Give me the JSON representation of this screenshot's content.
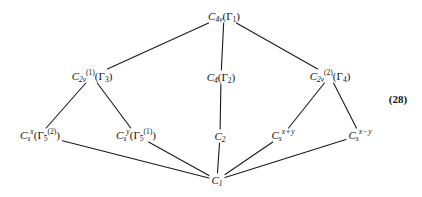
{
  "diagram": {
    "equation_number": "(28)",
    "line_color": "#1a1a1a",
    "background_color": "#ffffff",
    "nodes": [
      {
        "id": "c4v",
        "label": "C4v(Γ1)",
        "base": "C",
        "base_sub": "4v",
        "irrep": "Γ1",
        "x": 224,
        "y": 16
      },
      {
        "id": "c2v1",
        "label": "C2v(1)(Γ3)",
        "base": "C",
        "base_sub": "2v",
        "base_sup": "(1)",
        "irrep": "Γ3",
        "x": 92,
        "y": 76
      },
      {
        "id": "c4",
        "label": "C4(Γ2)",
        "base": "C",
        "base_sub": "4",
        "irrep": "Γ2",
        "x": 221,
        "y": 77
      },
      {
        "id": "c2v2",
        "label": "C2v(2)(Γ4)",
        "base": "C",
        "base_sub": "2v",
        "base_sup": "(2)",
        "irrep": "Γ4",
        "x": 330,
        "y": 76
      },
      {
        "id": "csx",
        "label": "Csx(Γ5(2))",
        "base": "C",
        "base_sub": "s",
        "base_sup": "x",
        "irrep": "Γ5(2)",
        "x": 40,
        "y": 135
      },
      {
        "id": "csy",
        "label": "Csy(Γ5(1))",
        "base": "C",
        "base_sub": "s",
        "base_sup": "y",
        "irrep": "Γ5(1)",
        "x": 136,
        "y": 135
      },
      {
        "id": "c2",
        "label": "C2",
        "base": "C",
        "base_sub": "2",
        "x": 220,
        "y": 136
      },
      {
        "id": "csxpy",
        "label": "Csx+y",
        "base": "C",
        "base_sub": "s",
        "base_sup": "x+y",
        "x": 283,
        "y": 135
      },
      {
        "id": "csxmy",
        "label": "Csx−y",
        "base": "C",
        "base_sub": "s",
        "base_sup": "x−y",
        "x": 360,
        "y": 135
      },
      {
        "id": "c1",
        "label": "C1",
        "base": "C",
        "base_sub": "1",
        "x": 217,
        "y": 180
      }
    ],
    "edges": [
      {
        "from": "c4v",
        "to": "c2v1"
      },
      {
        "from": "c4v",
        "to": "c4"
      },
      {
        "from": "c4v",
        "to": "c2v2"
      },
      {
        "from": "c2v1",
        "to": "csx"
      },
      {
        "from": "c2v1",
        "to": "csy"
      },
      {
        "from": "c4",
        "to": "c2"
      },
      {
        "from": "c2v2",
        "to": "csxpy"
      },
      {
        "from": "c2v2",
        "to": "csxmy"
      },
      {
        "from": "csx",
        "to": "c1"
      },
      {
        "from": "csy",
        "to": "c1"
      },
      {
        "from": "c2",
        "to": "c1"
      },
      {
        "from": "csxpy",
        "to": "c1"
      },
      {
        "from": "csxmy",
        "to": "c1"
      }
    ],
    "eqnum_pos": {
      "x": 398,
      "y": 99
    }
  }
}
